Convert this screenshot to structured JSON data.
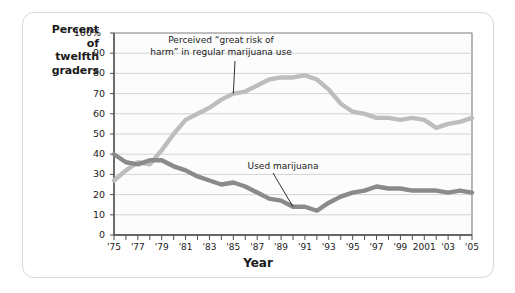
{
  "chart_data": {
    "type": "line",
    "title": "",
    "xlabel": "Year",
    "ylabel": "Percent of twelfth graders",
    "ylabel_lines": [
      "Percent",
      "of",
      "twelfth",
      "graders"
    ],
    "ylim": [
      0,
      100
    ],
    "xlim": [
      1975,
      2005
    ],
    "grid": true,
    "legend_position": "inline-annotations",
    "ytick_labels": [
      "100%",
      "90",
      "80",
      "70",
      "60",
      "50",
      "40",
      "30",
      "20",
      "10",
      "0"
    ],
    "ytick_values": [
      100,
      90,
      80,
      70,
      60,
      50,
      40,
      30,
      20,
      10,
      0
    ],
    "xtick_labels": [
      "'75",
      "'77",
      "'79",
      "'81",
      "'83",
      "'85",
      "'87",
      "'89",
      "'91",
      "'93",
      "'95",
      "'97",
      "'99",
      "2001",
      "'03",
      "'05"
    ],
    "xtick_values": [
      1975,
      1977,
      1979,
      1981,
      1983,
      1985,
      1987,
      1989,
      1991,
      1993,
      1995,
      1997,
      1999,
      2001,
      2003,
      2005
    ],
    "x": [
      1975,
      1976,
      1977,
      1978,
      1979,
      1980,
      1981,
      1982,
      1983,
      1984,
      1985,
      1986,
      1987,
      1988,
      1989,
      1990,
      1991,
      1992,
      1993,
      1994,
      1995,
      1996,
      1997,
      1998,
      1999,
      2000,
      2001,
      2002,
      2003,
      2004,
      2005
    ],
    "series": [
      {
        "name": "Perceived \"great risk of harm\" in regular marijuana use",
        "color": "#bdbdbd",
        "values": [
          27,
          32,
          36,
          35,
          42,
          50,
          57,
          60,
          63,
          67,
          70,
          71,
          74,
          77,
          78,
          78,
          79,
          77,
          72,
          65,
          61,
          60,
          58,
          58,
          57,
          58,
          57,
          53,
          55,
          56,
          58
        ]
      },
      {
        "name": "Used marijuana",
        "color": "#8a8a8a",
        "values": [
          40,
          36,
          35,
          37,
          37,
          34,
          32,
          29,
          27,
          25,
          26,
          24,
          21,
          18,
          17,
          14,
          14,
          12,
          16,
          19,
          21,
          22,
          24,
          23,
          23,
          22,
          22,
          22,
          21,
          22,
          21
        ]
      }
    ],
    "annotations": [
      {
        "id": "risk-annotation",
        "text": "Perceived “great risk of\nharm” in regular marijuana use",
        "target_x": 1985,
        "target_y": 70
      },
      {
        "id": "used-annotation",
        "text": "Used marijuana",
        "target_x": 1990,
        "target_y": 14
      }
    ]
  },
  "style": {
    "line_color_risk": "#bdbdbd",
    "line_color_used": "#8a8a8a",
    "grid_color": "#c9c9c9",
    "axis_color": "#4d4d4d",
    "plot_background": "#fcfcfc",
    "card_border": "#d8d8d8",
    "text_color": "#1a1a1a"
  }
}
